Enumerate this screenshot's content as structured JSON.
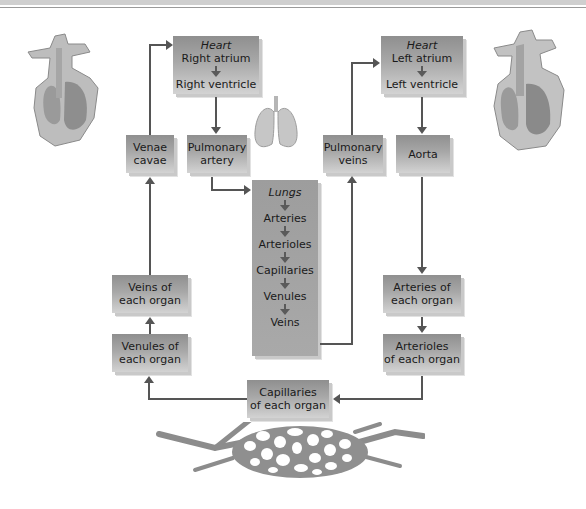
{
  "header": {
    "caption_fragment": "apillaries, venules, and veins of the lungs..."
  },
  "diagram": {
    "boxes": {
      "heart_right": {
        "header": "Heart",
        "line1": "Right atrium",
        "line2": "Right ventricle"
      },
      "heart_left": {
        "header": "Heart",
        "line1": "Left atrium",
        "line2": "Left ventricle"
      },
      "venae_cavae": {
        "line1": "Venae",
        "line2": "cavae"
      },
      "pulmonary_artery": {
        "line1": "Pulmonary",
        "line2": "artery"
      },
      "pulmonary_veins": {
        "line1": "Pulmonary",
        "line2": "veins"
      },
      "aorta": {
        "line1": "Aorta"
      },
      "lungs": {
        "header": "Lungs",
        "items": [
          "Arteries",
          "Arterioles",
          "Capillaries",
          "Venules",
          "Veins"
        ]
      },
      "veins_organ": {
        "line1": "Veins of",
        "line2": "each organ"
      },
      "venules_organ": {
        "line1": "Venules of",
        "line2": "each organ"
      },
      "arteries_organ": {
        "line1": "Arteries of",
        "line2": "each organ"
      },
      "arterioles_organ": {
        "line1": "Arterioles",
        "line2": "of each organ"
      },
      "capillaries_organ": {
        "line1": "Capillaries",
        "line2": "of each organ"
      }
    },
    "illustrations": [
      "heart-right-side-icon",
      "heart-left-side-icon",
      "lungs-icon",
      "capillary-bed-icon"
    ],
    "colors": {
      "box_dark": "#8f8f8f",
      "box_light": "#d3d3d3",
      "arrow": "#555555"
    }
  }
}
